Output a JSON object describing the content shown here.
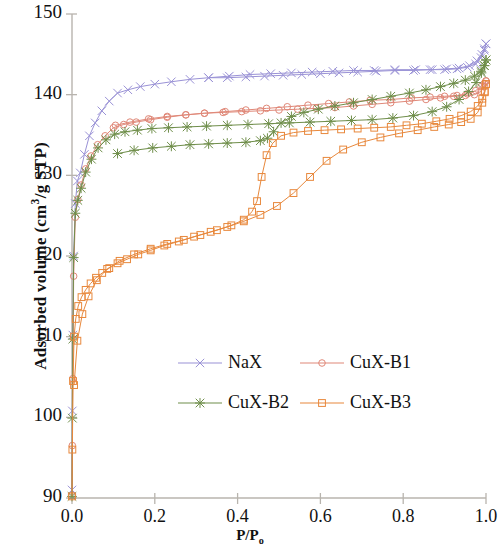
{
  "chart_data": {
    "type": "line",
    "title": "",
    "subtitle": "",
    "xlabel": "P/P₀",
    "ylabel": "Adsorbed volume (cm³/g STP)",
    "xlim": [
      0.0,
      1.0
    ],
    "ylim": [
      90,
      150
    ],
    "xticks": [
      "0.0",
      "0.2",
      "0.4",
      "0.6",
      "0.8",
      "1.0"
    ],
    "xtick_values": [
      0.0,
      0.2,
      0.4,
      0.6,
      0.8,
      1.0
    ],
    "yticks": [
      "90",
      "100",
      "110",
      "120",
      "130",
      "140",
      "150"
    ],
    "ytick_values": [
      90,
      100,
      110,
      120,
      130,
      140,
      150
    ],
    "grid": false,
    "legend_position": "center",
    "series": [
      {
        "name": "NaX",
        "color": "#9a92d6",
        "marker": "x",
        "adsorption": {
          "x": [
            0.0,
            0.0008,
            0.002,
            0.004,
            0.008,
            0.013,
            0.02,
            0.03,
            0.042,
            0.056,
            0.072,
            0.09,
            0.11,
            0.135,
            0.165,
            0.2,
            0.24,
            0.285,
            0.33,
            0.38,
            0.43,
            0.48,
            0.53,
            0.58,
            0.63,
            0.68,
            0.73,
            0.78,
            0.83,
            0.87,
            0.905,
            0.935,
            0.96,
            0.978,
            0.99,
            0.996,
            1.0
          ],
          "y": [
            91.0,
            100.8,
            110.2,
            120.0,
            126.5,
            129.3,
            130.3,
            132.6,
            134.9,
            136.5,
            138.0,
            139.2,
            140.2,
            140.6,
            141.0,
            141.3,
            141.6,
            141.9,
            142.1,
            142.3,
            142.5,
            142.6,
            142.7,
            142.8,
            142.9,
            143.0,
            143.0,
            143.1,
            143.1,
            143.1,
            143.2,
            143.3,
            143.6,
            144.2,
            145.0,
            145.7,
            146.3
          ]
        },
        "desorption": {
          "x": [
            1.0,
            0.996,
            0.988,
            0.975,
            0.955,
            0.93,
            0.9,
            0.865,
            0.825,
            0.78,
            0.735,
            0.69,
            0.645,
            0.6,
            0.555,
            0.51,
            0.465,
            0.42,
            0.375,
            0.33
          ],
          "y": [
            146.3,
            145.5,
            144.6,
            143.8,
            143.4,
            143.2,
            143.1,
            143.1,
            143.0,
            143.0,
            142.9,
            142.8,
            142.7,
            142.6,
            142.5,
            142.4,
            142.3,
            142.2,
            142.1,
            142.1
          ]
        }
      },
      {
        "name": "CuX-B1",
        "color": "#e08878",
        "marker": "o",
        "adsorption": {
          "x": [
            0.0,
            0.0008,
            0.002,
            0.004,
            0.008,
            0.014,
            0.022,
            0.033,
            0.046,
            0.062,
            0.08,
            0.1,
            0.125,
            0.155,
            0.19,
            0.23,
            0.275,
            0.32,
            0.37,
            0.42,
            0.47,
            0.52,
            0.57,
            0.62,
            0.67,
            0.72,
            0.77,
            0.82,
            0.865,
            0.9,
            0.93,
            0.955,
            0.975,
            0.988,
            0.996,
            1.0
          ],
          "y": [
            90.3,
            96.5,
            104.8,
            117.5,
            124.8,
            127.0,
            128.8,
            130.8,
            132.4,
            133.8,
            134.9,
            135.9,
            136.3,
            136.6,
            136.9,
            137.2,
            137.5,
            137.7,
            137.9,
            138.1,
            138.3,
            138.5,
            138.7,
            138.9,
            139.1,
            139.3,
            139.4,
            139.6,
            139.7,
            139.8,
            139.9,
            140.1,
            140.5,
            141.0,
            141.4,
            141.7
          ]
        },
        "desorption": {
          "x": [
            1.0,
            0.996,
            0.988,
            0.972,
            0.95,
            0.922,
            0.89,
            0.855,
            0.815,
            0.77,
            0.725,
            0.68,
            0.635,
            0.59,
            0.545,
            0.5,
            0.455,
            0.41,
            0.365,
            0.32,
            0.275,
            0.23,
            0.185,
            0.14,
            0.105
          ],
          "y": [
            141.7,
            141.0,
            140.4,
            140.0,
            139.9,
            139.8,
            139.6,
            139.4,
            139.2,
            139.0,
            138.8,
            138.6,
            138.4,
            138.3,
            138.2,
            138.1,
            138.0,
            137.9,
            137.8,
            137.7,
            137.5,
            137.3,
            137.0,
            136.6,
            136.2
          ]
        }
      },
      {
        "name": "CuX-B2",
        "color": "#6f8e4a",
        "marker": "star",
        "adsorption": {
          "x": [
            0.0,
            0.0008,
            0.002,
            0.004,
            0.008,
            0.014,
            0.022,
            0.033,
            0.047,
            0.063,
            0.082,
            0.103,
            0.128,
            0.158,
            0.193,
            0.233,
            0.278,
            0.325,
            0.375,
            0.425,
            0.475,
            0.525,
            0.575,
            0.625,
            0.675,
            0.725,
            0.775,
            0.825,
            0.87,
            0.905,
            0.935,
            0.958,
            0.976,
            0.989,
            0.996,
            1.0
          ],
          "y": [
            90.2,
            99.9,
            109.7,
            119.8,
            125.3,
            126.9,
            128.4,
            130.4,
            132.0,
            133.4,
            134.4,
            135.1,
            135.4,
            135.6,
            135.8,
            135.9,
            136.0,
            136.1,
            136.2,
            136.3,
            136.4,
            136.5,
            136.6,
            136.7,
            136.8,
            136.9,
            137.1,
            137.4,
            137.9,
            138.5,
            139.4,
            140.4,
            141.5,
            142.7,
            143.6,
            144.3
          ]
        },
        "desorption": {
          "x": [
            1.0,
            0.996,
            0.988,
            0.972,
            0.95,
            0.922,
            0.89,
            0.855,
            0.815,
            0.77,
            0.725,
            0.68,
            0.635,
            0.595,
            0.56,
            0.53,
            0.505,
            0.487,
            0.472,
            0.455,
            0.42,
            0.375,
            0.33,
            0.285,
            0.24,
            0.195,
            0.15,
            0.11
          ],
          "y": [
            144.3,
            143.6,
            142.9,
            142.3,
            141.8,
            141.4,
            141.0,
            140.6,
            140.2,
            139.8,
            139.4,
            139.0,
            138.6,
            138.2,
            137.8,
            137.3,
            136.5,
            135.4,
            134.6,
            134.3,
            134.1,
            134.0,
            133.9,
            133.8,
            133.6,
            133.4,
            133.1,
            132.7
          ]
        }
      },
      {
        "name": "CuX-B3",
        "color": "#e8883c",
        "marker": "square",
        "adsorption": {
          "x": [
            0.0,
            0.0009,
            0.0025,
            0.005,
            0.009,
            0.015,
            0.023,
            0.033,
            0.045,
            0.058,
            0.073,
            0.09,
            0.11,
            0.133,
            0.16,
            0.19,
            0.223,
            0.258,
            0.295,
            0.335,
            0.375,
            0.415,
            0.455,
            0.495,
            0.535,
            0.575,
            0.615,
            0.655,
            0.7,
            0.745,
            0.79,
            0.835,
            0.875,
            0.91,
            0.94,
            0.963,
            0.98,
            0.991,
            0.997,
            1.0
          ],
          "y": [
            90.2,
            96.0,
            104.5,
            110.0,
            112.2,
            113.8,
            114.9,
            115.8,
            116.6,
            117.3,
            117.9,
            118.5,
            119.1,
            119.6,
            120.2,
            120.7,
            121.3,
            121.8,
            122.4,
            123.0,
            123.6,
            124.3,
            125.1,
            126.2,
            127.8,
            129.8,
            131.8,
            133.2,
            134.1,
            134.7,
            135.2,
            135.6,
            136.0,
            136.3,
            136.6,
            137.0,
            137.8,
            139.0,
            140.3,
            141.3
          ]
        },
        "desorption": {
          "x": [
            1.0,
            0.997,
            0.991,
            0.98,
            0.963,
            0.94,
            0.912,
            0.88,
            0.845,
            0.808,
            0.77,
            0.73,
            0.69,
            0.65,
            0.61,
            0.57,
            0.535,
            0.505,
            0.485,
            0.47,
            0.458,
            0.447,
            0.435,
            0.415,
            0.385,
            0.35,
            0.31,
            0.27,
            0.23,
            0.19,
            0.15,
            0.115,
            0.085,
            0.06,
            0.04,
            0.025,
            0.013,
            0.005
          ],
          "y": [
            141.3,
            140.4,
            139.5,
            138.6,
            137.9,
            137.4,
            137.0,
            136.7,
            136.4,
            136.2,
            136.0,
            135.9,
            135.8,
            135.7,
            135.6,
            135.5,
            135.3,
            134.9,
            134.0,
            132.5,
            129.8,
            126.8,
            125.5,
            124.5,
            123.8,
            123.2,
            122.6,
            122.0,
            121.5,
            120.9,
            120.2,
            119.4,
            118.4,
            117.0,
            115.0,
            112.8,
            109.5,
            104.0
          ]
        }
      }
    ]
  },
  "legend": {
    "items": [
      {
        "label": "NaX",
        "color": "#9a92d6",
        "marker": "x"
      },
      {
        "label": "CuX-B1",
        "color": "#e08878",
        "marker": "o"
      },
      {
        "label": "CuX-B2",
        "color": "#6f8e4a",
        "marker": "star"
      },
      {
        "label": "CuX-B3",
        "color": "#e8883c",
        "marker": "square"
      }
    ]
  },
  "axis": {
    "x_title": "P/P₀",
    "y_title": "Adsorbed volume (cm³/g STP)"
  }
}
